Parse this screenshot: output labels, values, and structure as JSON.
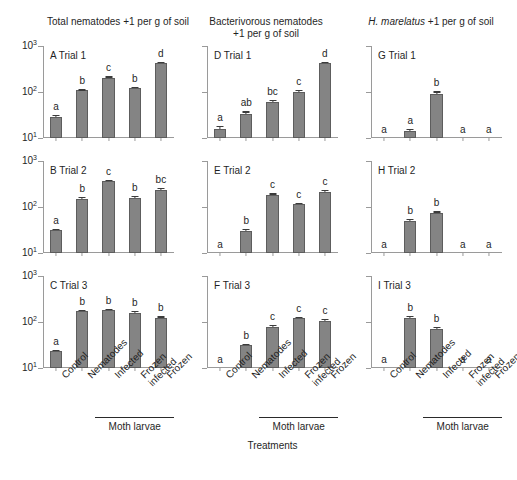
{
  "figure": {
    "column_titles": [
      {
        "line1": "Total nematodes  +1 per g of soil",
        "line2": ""
      },
      {
        "line1": "Bacterivorous nematodes",
        "line2": "+1 per g of soil"
      },
      {
        "line1_italic": "H. marelatus",
        "line1_rest": " +1 per g of soil",
        "line2": ""
      }
    ],
    "x_axis_title": "Treatments",
    "group_label": "Moth larvae",
    "categories": [
      "Control",
      "Nematodes",
      "Infected",
      "Frozen infected",
      "Frozen"
    ],
    "category_lines": [
      [
        "Control"
      ],
      [
        "Nematodes"
      ],
      [
        "Infected"
      ],
      [
        "Frozen",
        "infected"
      ],
      [
        "Frozen"
      ]
    ],
    "y_ticks": [
      {
        "label": "10",
        "exp": "1",
        "value": 10
      },
      {
        "label": "10",
        "exp": "2",
        "value": 100
      },
      {
        "label": "10",
        "exp": "3",
        "value": 1000
      }
    ]
  },
  "chart_data": {
    "type": "bar",
    "xlabel": "Treatments",
    "ylabel": "Nematodes +1 per g of soil",
    "yscale": "log",
    "ylim": [
      10,
      1000
    ],
    "ytick_values": [
      10,
      100,
      1000
    ],
    "ytick_labels": [
      "10^1",
      "10^2",
      "10^3"
    ],
    "grid": false,
    "legend": "none",
    "categories": [
      "Control",
      "Nematodes",
      "Infected",
      "Frozen infected",
      "Frozen"
    ],
    "columns": [
      {
        "name": "Total nematodes +1 per g of soil",
        "panels": [
          {
            "id": "A",
            "label": "A Trial 1",
            "values": [
              29,
              108,
              205,
              122,
              430
            ],
            "errors": [
              3,
              6,
              14,
              8,
              30
            ],
            "sig_letters": [
              "a",
              "b",
              "c",
              "b",
              "d"
            ]
          },
          {
            "id": "B",
            "label": "B Trial 2",
            "values": [
              31,
              152,
              360,
              160,
              235
            ],
            "errors": [
              3,
              11,
              30,
              12,
              22
            ],
            "sig_letters": [
              "a",
              "b",
              "c",
              "b",
              "bc"
            ]
          },
          {
            "id": "C",
            "label": "C Trial 3",
            "values": [
              23,
              170,
              178,
              160,
              123
            ],
            "errors": [
              2,
              12,
              13,
              12,
              9
            ],
            "sig_letters": [
              "a",
              "b",
              "b",
              "b",
              "b"
            ]
          }
        ]
      },
      {
        "name": "Bacterivorous nematodes +1 per g of soil",
        "panels": [
          {
            "id": "D",
            "label": "D Trial 1",
            "values": [
              16,
              34,
              60,
              101,
              420
            ],
            "errors": [
              2,
              4,
              6,
              9,
              40
            ],
            "sig_letters": [
              "a",
              "ab",
              "bc",
              "c",
              "d"
            ]
          },
          {
            "id": "E",
            "label": "E Trial 2",
            "values": [
              10,
              30,
              185,
              116,
              215
            ],
            "errors": [
              0,
              3,
              12,
              9,
              18
            ],
            "sig_letters": [
              "a",
              "b",
              "c",
              "c",
              "c"
            ]
          },
          {
            "id": "F",
            "label": "F Trial 3",
            "values": [
              10,
              31,
              78,
              122,
              107
            ],
            "errors": [
              0,
              3,
              7,
              9,
              9
            ],
            "sig_letters": [
              "a",
              "b",
              "c",
              "c",
              "c"
            ]
          }
        ]
      },
      {
        "name": "H. marelatus +1 per g of soil",
        "panels": [
          {
            "id": "G",
            "label": "G Trial 1",
            "values": [
              10,
              14,
              92,
              10,
              10
            ],
            "errors": [
              0,
              2,
              11,
              0,
              0
            ],
            "sig_letters": [
              "a",
              "a",
              "b",
              "a",
              "a"
            ]
          },
          {
            "id": "H",
            "label": "H Trial 2",
            "values": [
              10,
              50,
              74,
              10,
              10
            ],
            "errors": [
              0,
              5,
              6,
              0,
              0
            ],
            "sig_letters": [
              "a",
              "b",
              "b",
              "a",
              "a"
            ]
          },
          {
            "id": "I",
            "label": "I Trial 3",
            "values": [
              10,
              125,
              70,
              10,
              10
            ],
            "errors": [
              0,
              11,
              7,
              0,
              0
            ],
            "sig_letters": [
              "a",
              "b",
              "b",
              "a",
              "a"
            ]
          }
        ]
      }
    ]
  }
}
